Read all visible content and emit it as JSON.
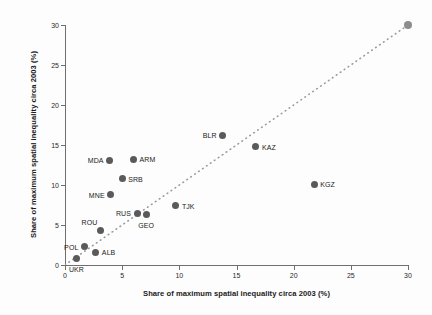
{
  "chart_data": {
    "type": "scatter",
    "title": "",
    "xlabel": "Share of maximum spatial inequality circa 2003 (%)",
    "ylabel": "Share of maximum spatial inequality circa 2003 (%)",
    "xlim": [
      0,
      30
    ],
    "ylim": [
      0,
      30
    ],
    "xticks": [
      "0",
      "5",
      "10",
      "15",
      "20",
      "25",
      "30"
    ],
    "yticks": [
      "0",
      "5",
      "10",
      "15",
      "20",
      "25",
      "30"
    ],
    "grid": false,
    "legend": "none",
    "marker_color": "#5a5a5a",
    "refline_color": "#9a9a9a",
    "annotations": [
      {
        "label": "45-degree reference line (dotted)"
      }
    ],
    "points": [
      {
        "label": "UKR",
        "x": 1.0,
        "y": 0.8,
        "label_pos": "below"
      },
      {
        "label": "POL",
        "x": 1.7,
        "y": 2.3,
        "label_pos": "left"
      },
      {
        "label": "ALB",
        "x": 2.7,
        "y": 1.6,
        "label_pos": "right"
      },
      {
        "label": "ROU",
        "x": 3.1,
        "y": 4.3,
        "label_pos": "above-left"
      },
      {
        "label": "MDA",
        "x": 3.9,
        "y": 13.1,
        "label_pos": "left"
      },
      {
        "label": "MNE",
        "x": 4.0,
        "y": 8.8,
        "label_pos": "left"
      },
      {
        "label": "SRB",
        "x": 5.0,
        "y": 10.8,
        "label_pos": "right"
      },
      {
        "label": "ARM",
        "x": 6.0,
        "y": 13.2,
        "label_pos": "right"
      },
      {
        "label": "RUS",
        "x": 6.3,
        "y": 6.5,
        "label_pos": "left"
      },
      {
        "label": "GEO",
        "x": 7.1,
        "y": 6.3,
        "label_pos": "below"
      },
      {
        "label": "TJK",
        "x": 9.7,
        "y": 7.4,
        "label_pos": "right"
      },
      {
        "label": "BLR",
        "x": 13.8,
        "y": 16.2,
        "label_pos": "left"
      },
      {
        "label": "KAZ",
        "x": 16.7,
        "y": 14.8,
        "label_pos": "right"
      },
      {
        "label": "KGZ",
        "x": 21.8,
        "y": 10.1,
        "label_pos": "right"
      },
      {
        "label": "",
        "x": 30.0,
        "y": 30.0,
        "label_pos": "none"
      }
    ]
  }
}
